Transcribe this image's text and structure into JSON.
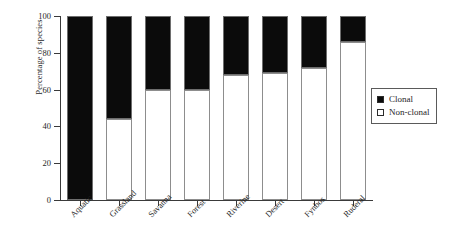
{
  "chart_data": {
    "type": "bar",
    "subtype": "stacked-100",
    "title": "",
    "xlabel": "",
    "ylabel": "Percentage of species",
    "ylim": [
      0,
      100
    ],
    "yticks": [
      0,
      20,
      40,
      60,
      80,
      100
    ],
    "ytick_labels": [
      "0",
      "20",
      "40",
      "60",
      "80",
      "100"
    ],
    "grid": false,
    "categories": [
      "Aquatic",
      "Grassland",
      "Savanna",
      "Forest",
      "Riverine",
      "Desert",
      "Fynbos",
      "Ruderal"
    ],
    "series": [
      {
        "name": "Non-clonal",
        "color": "#ffffff",
        "values": [
          0,
          44,
          60,
          60,
          68,
          69,
          72,
          86
        ]
      },
      {
        "name": "Clonal",
        "color": "#0b0b0b",
        "values": [
          100,
          56,
          40,
          40,
          32,
          31,
          28,
          14
        ]
      }
    ],
    "legend": {
      "position": "right",
      "entries": [
        {
          "label": "Clonal",
          "swatch": "filled"
        },
        {
          "label": "Non-clonal",
          "swatch": "empty"
        }
      ]
    }
  }
}
